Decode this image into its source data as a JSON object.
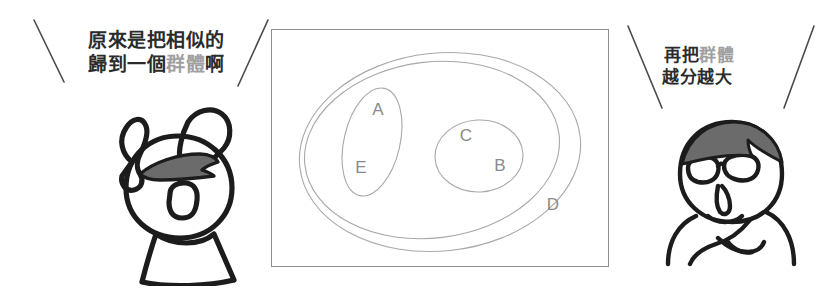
{
  "page": {
    "background_color": "#ffffff",
    "width": 839,
    "height": 293
  },
  "speech_left": {
    "name": "surprised-character-speech",
    "line1": "原來是把相似的",
    "line2_part1": "歸到一個",
    "line2_highlight": "群體",
    "line2_part3": "啊",
    "highlight_color": "#a0a0a0",
    "text_color": "#2b2b2b"
  },
  "speech_right": {
    "name": "glasses-character-speech",
    "line1_part1": "再把",
    "line1_highlight": "群體",
    "line2": "越分越大",
    "highlight_color": "#a0a0a0",
    "text_color": "#2b2b2b"
  },
  "venn": {
    "border_color": "#8d8d8d",
    "ellipse_stroke": "#a8a8a8",
    "label_color": "#8a8a8a",
    "labels": [
      {
        "id": "A",
        "text": "A",
        "x": 106,
        "y": 85
      },
      {
        "id": "E",
        "text": "E",
        "x": 90,
        "y": 142
      },
      {
        "id": "C",
        "text": "C",
        "x": 196,
        "y": 110
      },
      {
        "id": "B",
        "text": "B",
        "x": 228,
        "y": 140
      },
      {
        "id": "D",
        "text": "D",
        "x": 282,
        "y": 180
      }
    ],
    "ellipses": [
      {
        "id": "D-outer",
        "cx": 165,
        "cy": 120,
        "rx": 140,
        "ry": 98,
        "rotate": -6
      },
      {
        "id": "inner-group",
        "cx": 158,
        "cy": 120,
        "rx": 128,
        "ry": 88,
        "rotate": -6
      },
      {
        "id": "AE",
        "cx": 100,
        "cy": 112,
        "rx": 27,
        "ry": 54,
        "rotate": 12
      },
      {
        "id": "CB",
        "cx": 207,
        "cy": 126,
        "rx": 43,
        "ry": 35,
        "rotate": 0
      }
    ]
  },
  "dividers": [
    {
      "id": "divider-far-left",
      "direction": "backslash"
    },
    {
      "id": "divider-left-inner",
      "direction": "slash"
    },
    {
      "id": "divider-right-inner",
      "direction": "backslash"
    },
    {
      "id": "divider-far-right",
      "direction": "slash"
    }
  ],
  "characters": [
    {
      "id": "surprised-character",
      "description": "hand-drawn person with both hands raised, open mouth, gray hair",
      "hair_color": "#6b6b6b",
      "outline_color": "#1c1c1c"
    },
    {
      "id": "glasses-character",
      "description": "hand-drawn person with glasses and crossed arms, gray hair",
      "hair_color": "#6b6b6b",
      "outline_color": "#1c1c1c"
    }
  ]
}
